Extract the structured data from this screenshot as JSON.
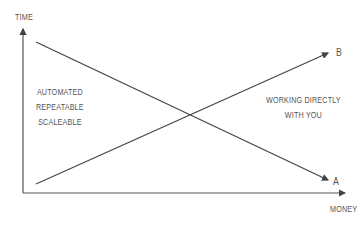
{
  "diagram": {
    "y_axis_label": "TIME",
    "x_axis_label": "MONEY",
    "line_a_label": "A",
    "line_b_label": "B",
    "left_region": [
      "AUTOMATED",
      "REPEATABLE",
      "SCALEABLE"
    ],
    "right_region": [
      "WORKING DIRECTLY",
      "WITH YOU"
    ],
    "colors": {
      "lines": "#444444",
      "text": "#555555",
      "background": "#ffffff"
    }
  }
}
